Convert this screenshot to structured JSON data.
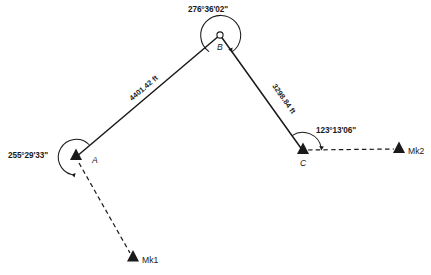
{
  "diagram": {
    "type": "closed-traverse-with-azimuth-marks",
    "units": "ft",
    "stations": [
      {
        "id": "A",
        "label": "A",
        "marker": "triangle-filled",
        "x": 76,
        "y": 157,
        "label_x": 92,
        "label_y": 163,
        "angle": {
          "value": "255°29'33\"",
          "degrees": 255,
          "minutes": 29,
          "seconds": 33,
          "label_x": 8,
          "label_y": 158,
          "arc_radius": 17,
          "arc_start_deg": 60,
          "arc_sweep_deg": 255
        }
      },
      {
        "id": "B",
        "label": "B",
        "marker": "circle-open",
        "x": 220,
        "y": 35,
        "label_x": 219,
        "label_y": 49,
        "angle": {
          "value": "276°36'02\"",
          "degrees": 276,
          "minutes": 36,
          "seconds": 2,
          "label_x": 188,
          "label_y": 12,
          "arc_radius": 20,
          "arc_start_deg": 236,
          "arc_sweep_deg": 276
        }
      },
      {
        "id": "C",
        "label": "C",
        "marker": "triangle-filled",
        "x": 303,
        "y": 151,
        "label_x": 300,
        "label_y": 166,
        "angle": {
          "value": "123°13'06\"",
          "degrees": 123,
          "minutes": 13,
          "seconds": 6,
          "label_x": 316,
          "label_y": 133,
          "arc_radius": 19,
          "arc_start_deg": 125,
          "arc_sweep_deg": 123
        }
      }
    ],
    "marks": [
      {
        "id": "Mk1",
        "label": "Mk1",
        "marker": "triangle-filled",
        "x": 133,
        "y": 258,
        "label_x": 141,
        "label_y": 263,
        "from_station": "A",
        "line_style": "dashed"
      },
      {
        "id": "Mk2",
        "label": "Mk2",
        "marker": "triangle-filled",
        "x": 399,
        "y": 149,
        "label_x": 407,
        "label_y": 154,
        "from_station": "C",
        "line_style": "dashed"
      }
    ],
    "courses": [
      {
        "id": "AB",
        "from": "A",
        "to": "B",
        "distance": "4401.42 ft",
        "distance_value": 4401.42,
        "line_style": "solid",
        "label_x": 132,
        "label_y": 101,
        "label_rotation": -40
      },
      {
        "id": "BC",
        "from": "B",
        "to": "C",
        "distance": "3298.84 ft",
        "distance_value": 3298.84,
        "line_style": "solid",
        "label_x": 272,
        "label_y": 86,
        "label_rotation": 55
      }
    ],
    "colors": {
      "ink": "#1a1a1a",
      "background": "#ffffff"
    }
  }
}
